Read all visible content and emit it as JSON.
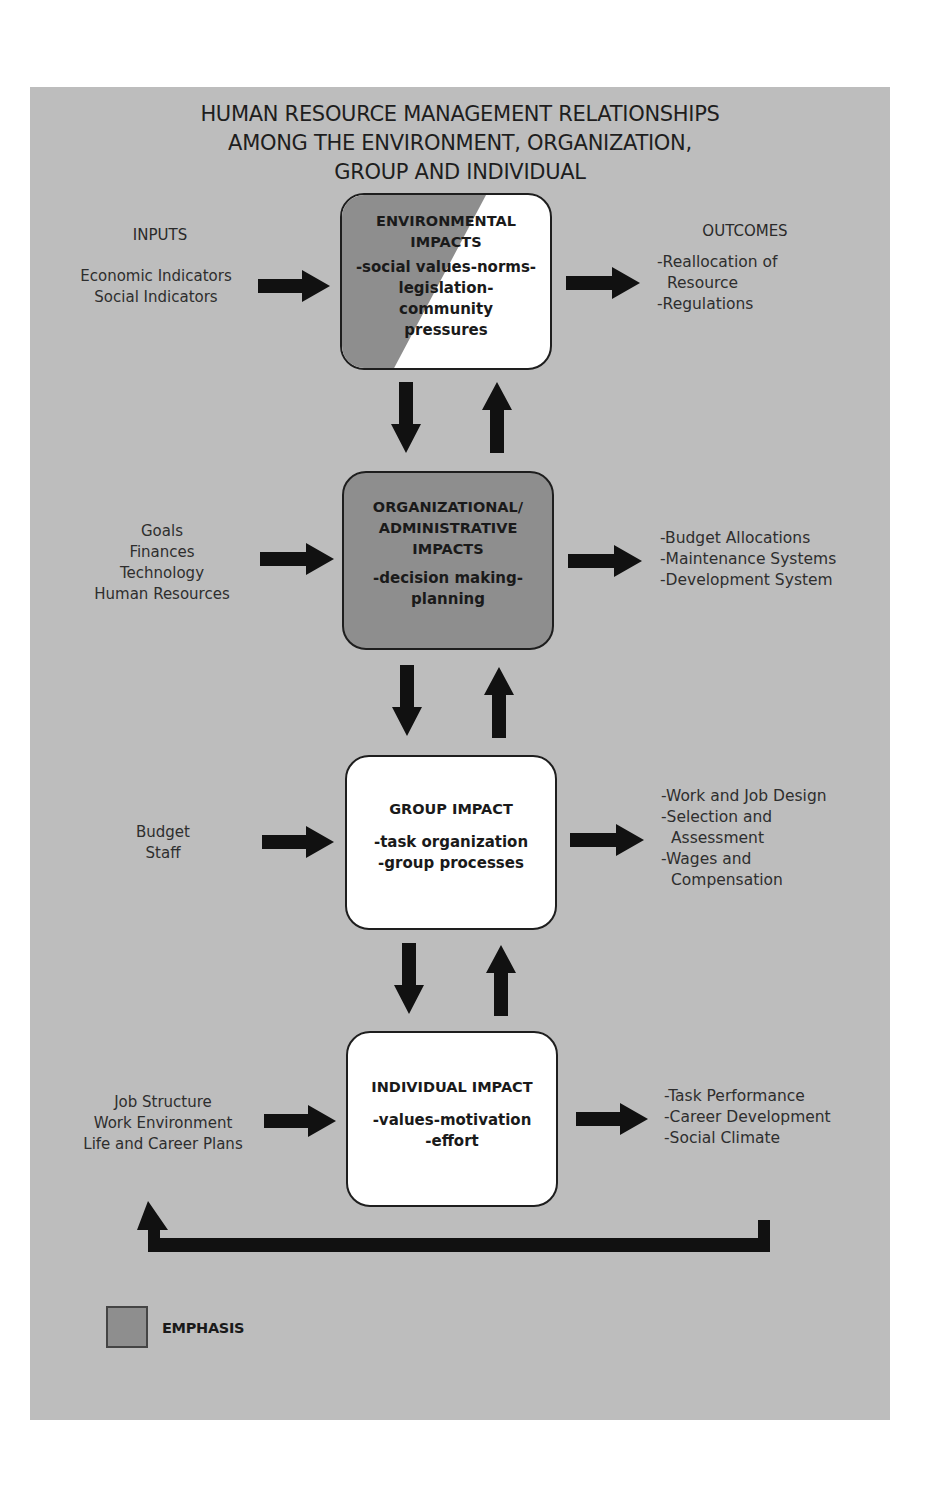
{
  "title": {
    "lines": [
      "HUMAN RESOURCE MANAGEMENT RELATIONSHIPS",
      "AMONG THE ENVIRONMENT, ORGANIZATION,",
      "GROUP AND INDIVIDUAL"
    ]
  },
  "column_headers": {
    "inputs": "INPUTS",
    "outcomes": "OUTCOMES"
  },
  "levels": [
    {
      "id": "environmental",
      "emphasis": "partial",
      "title_lines": [
        "ENVIRONMENTAL",
        "IMPACTS"
      ],
      "detail_lines": [
        "-social values-norms-",
        "legislation-",
        "community",
        "pressures"
      ],
      "inputs": [
        "Economic Indicators",
        "Social Indicators"
      ],
      "outcomes": [
        "-Reallocation of",
        " Resource",
        "-Regulations"
      ]
    },
    {
      "id": "organizational",
      "emphasis": "full",
      "title_lines": [
        "ORGANIZATIONAL/",
        "ADMINISTRATIVE",
        "IMPACTS"
      ],
      "detail_lines": [
        "-decision making-",
        "planning"
      ],
      "inputs": [
        "Goals",
        "Finances",
        "Technology",
        "Human Resources"
      ],
      "outcomes": [
        "-Budget Allocations",
        "-Maintenance Systems",
        "-Development System"
      ]
    },
    {
      "id": "group",
      "emphasis": "none",
      "title_lines": [
        "GROUP IMPACT"
      ],
      "detail_lines": [
        "-task organization",
        "-group processes"
      ],
      "inputs": [
        "Budget",
        "Staff"
      ],
      "outcomes": [
        "-Work and Job Design",
        "-Selection and",
        " Assessment",
        "-Wages and",
        " Compensation"
      ]
    },
    {
      "id": "individual",
      "emphasis": "none",
      "title_lines": [
        "INDIVIDUAL IMPACT"
      ],
      "detail_lines": [
        "-values-motivation",
        "-effort"
      ],
      "inputs": [
        "Job Structure",
        "Work Environment",
        "Life and Career Plans"
      ],
      "outcomes": [
        "-Task Performance",
        "-Career Development",
        "-Social Climate"
      ]
    }
  ],
  "legend": {
    "label": "EMPHASIS",
    "swatch_color": "#8e8e8e"
  },
  "colors": {
    "panel": "#bdbdbd",
    "emphasis": "#8e8e8e",
    "box_fill": "#ffffff",
    "arrow": "#111111"
  }
}
